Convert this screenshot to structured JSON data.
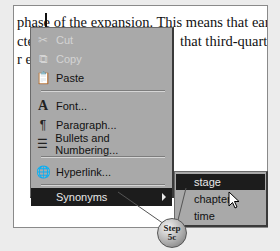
{
  "document": {
    "lines": [
      "phase of the expansion. This means that earnin",
      "cte",
      "that third-quarter",
      "r e:"
    ]
  },
  "context_menu": {
    "items": [
      {
        "label": "Cut",
        "icon": "scissors-icon",
        "disabled": true
      },
      {
        "label": "Copy",
        "icon": "copy-icon",
        "disabled": true
      },
      {
        "label": "Paste",
        "icon": "paste-icon",
        "disabled": false
      },
      {
        "label": "Font...",
        "icon": "font-icon",
        "disabled": false
      },
      {
        "label": "Paragraph...",
        "icon": "paragraph-icon",
        "disabled": false
      },
      {
        "label": "Bullets and Numbering...",
        "icon": "bullets-icon",
        "disabled": false
      },
      {
        "label": "Hyperlink...",
        "icon": "hyperlink-icon",
        "disabled": false
      },
      {
        "label": "Synonyms",
        "icon": "",
        "disabled": false,
        "highlighted": true,
        "has_submenu": true
      }
    ]
  },
  "submenu": {
    "items": [
      {
        "label": "stage",
        "highlighted": true
      },
      {
        "label": "chapter"
      },
      {
        "label": "time"
      }
    ]
  },
  "step_badge": {
    "line1": "Step",
    "line2": "5c"
  }
}
